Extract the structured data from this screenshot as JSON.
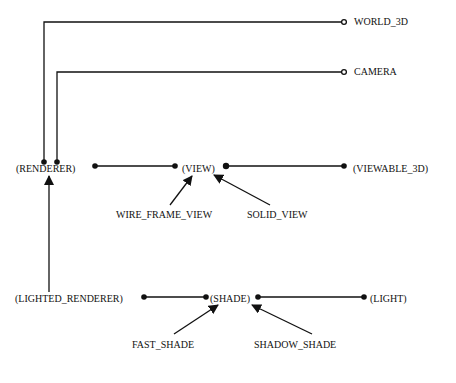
{
  "diagram": {
    "type": "class-relationship-diagram",
    "nodes": {
      "world_3d": "WORLD_3D",
      "camera": "CAMERA",
      "renderer": "(RENDERER)",
      "view": "(VIEW)",
      "viewable_3d": "(VIEWABLE_3D)",
      "wire_frame_view": "WIRE_FRAME_VIEW",
      "solid_view": "SOLID_VIEW",
      "lighted_renderer": "(LIGHTED_RENDERER)",
      "shade": "(SHADE)",
      "light": "(LIGHT)",
      "fast_shade": "FAST_SHADE",
      "shadow_shade": "SHADOW_SHADE"
    },
    "edges": [
      {
        "from": "renderer",
        "to": "world_3d",
        "kind": "client-open-circle"
      },
      {
        "from": "renderer",
        "to": "camera",
        "kind": "client-open-circle"
      },
      {
        "from": "renderer",
        "to": "view",
        "kind": "association-dots"
      },
      {
        "from": "view",
        "to": "viewable_3d",
        "kind": "association-dots"
      },
      {
        "from": "wire_frame_view",
        "to": "view",
        "kind": "inheritance-arrow"
      },
      {
        "from": "solid_view",
        "to": "view",
        "kind": "inheritance-arrow"
      },
      {
        "from": "lighted_renderer",
        "to": "renderer",
        "kind": "inheritance-arrow"
      },
      {
        "from": "lighted_renderer",
        "to": "shade",
        "kind": "association-dots"
      },
      {
        "from": "shade",
        "to": "light",
        "kind": "association-dots"
      },
      {
        "from": "fast_shade",
        "to": "shade",
        "kind": "inheritance-arrow"
      },
      {
        "from": "shadow_shade",
        "to": "shade",
        "kind": "inheritance-arrow"
      }
    ]
  }
}
